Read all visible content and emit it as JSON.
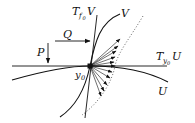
{
  "diagram": {
    "title": "",
    "labels": {
      "tangent_V": {
        "main": "T",
        "sub": "f",
        "subsub": "0",
        "space": "V"
      },
      "curve_V": "V",
      "arrow_Q": "Q",
      "arrow_P": "P",
      "tangent_U": {
        "main": "T",
        "sub": "y",
        "subsub": "0",
        "space": "U"
      },
      "curve_U": "U",
      "point": {
        "main": "y",
        "sub": "0"
      }
    },
    "elements": [
      {
        "id": "tangent-line-TyU",
        "type": "line",
        "style": "solid",
        "desc": "horizontal tangent line to U at y0"
      },
      {
        "id": "curve-U",
        "type": "curve",
        "style": "solid",
        "desc": "curve U passing through y0"
      },
      {
        "id": "tangent-line-TfV",
        "type": "line",
        "style": "solid",
        "desc": "near-vertical tangent line to V at y0"
      },
      {
        "id": "curve-V",
        "type": "curve",
        "style": "solid",
        "desc": "curve V passing through y0"
      },
      {
        "id": "dotted-curve",
        "type": "curve",
        "style": "dotted",
        "desc": "dotted boundary curve"
      },
      {
        "id": "fan-arrows",
        "type": "arrows",
        "count": 11,
        "desc": "arrows fanning out from y0 to the dotted curve"
      },
      {
        "id": "arrow-Q",
        "type": "arrow",
        "direction": "right"
      },
      {
        "id": "arrow-P",
        "type": "arrow",
        "direction": "down"
      },
      {
        "id": "point-y0",
        "type": "point"
      }
    ],
    "colors": {
      "stroke": "#111111",
      "background": "#ffffff"
    }
  }
}
